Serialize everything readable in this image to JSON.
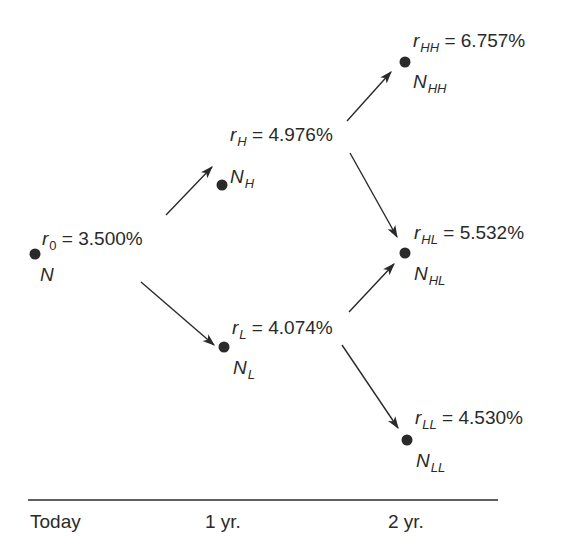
{
  "tree": {
    "nodes": [
      {
        "id": "root",
        "rate_symbol": "r",
        "rate_sub": "0",
        "rate_value": "3.500%",
        "price_symbol": "N",
        "price_sub": ""
      },
      {
        "id": "H",
        "rate_symbol": "r",
        "rate_sub": "H",
        "rate_value": "4.976%",
        "price_symbol": "N",
        "price_sub": "H"
      },
      {
        "id": "L",
        "rate_symbol": "r",
        "rate_sub": "L",
        "rate_value": "4.074%",
        "price_symbol": "N",
        "price_sub": "L"
      },
      {
        "id": "HH",
        "rate_symbol": "r",
        "rate_sub": "HH",
        "rate_value": "6.757%",
        "price_symbol": "N",
        "price_sub": "HH"
      },
      {
        "id": "HL",
        "rate_symbol": "r",
        "rate_sub": "HL",
        "rate_value": "5.532%",
        "price_symbol": "N",
        "price_sub": "HL"
      },
      {
        "id": "LL",
        "rate_symbol": "r",
        "rate_sub": "LL",
        "rate_value": "4.530%",
        "price_symbol": "N",
        "price_sub": "LL"
      }
    ],
    "edges": [
      {
        "from": "root",
        "to": "H"
      },
      {
        "from": "root",
        "to": "L"
      },
      {
        "from": "H",
        "to": "HH"
      },
      {
        "from": "H",
        "to": "HL"
      },
      {
        "from": "L",
        "to": "HL"
      },
      {
        "from": "L",
        "to": "LL"
      }
    ],
    "equals": "="
  },
  "timeline": {
    "labels": [
      "Today",
      "1 yr.",
      "2 yr."
    ]
  },
  "colors": {
    "ink": "#2a2a2a",
    "background": "#ffffff"
  }
}
